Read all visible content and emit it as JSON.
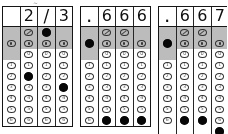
{
  "sheet": {
    "title": "grid-in answer bubble sheets",
    "stray_mark": "~",
    "row_labels": [
      "fraction-bar",
      "decimal-point",
      "0",
      "1",
      "2",
      "3",
      "4",
      "5",
      "6"
    ],
    "colors": {
      "ink": "#0d0d0d",
      "rule": "#2a2a2a",
      "shade": "#b9b9b9",
      "paper": "#ffffff",
      "bubble_outline": "#333333"
    },
    "grids": [
      {
        "name": "grid-1",
        "answer": [
          "",
          "2",
          "/",
          "3"
        ],
        "columns": [
          {
            "name": "col-1",
            "written": "",
            "has_slash_bubble": false,
            "has_dot_bubble": true,
            "has_zero_bubble": false,
            "digits": [
              "1",
              "2",
              "3",
              "4",
              "5",
              "6"
            ],
            "filled": null
          },
          {
            "name": "col-2",
            "written": "2",
            "has_slash_bubble": true,
            "has_dot_bubble": true,
            "has_zero_bubble": true,
            "digits": [
              "0",
              "1",
              "2",
              "3",
              "4",
              "5",
              "6"
            ],
            "filled": "2"
          },
          {
            "name": "col-3",
            "written": "/",
            "has_slash_bubble": true,
            "has_dot_bubble": true,
            "has_zero_bubble": true,
            "digits": [
              "0",
              "1",
              "2",
              "3",
              "4",
              "5",
              "6"
            ],
            "filled": "/"
          },
          {
            "name": "col-4",
            "written": "3",
            "has_slash_bubble": false,
            "has_dot_bubble": true,
            "has_zero_bubble": true,
            "digits": [
              "0",
              "1",
              "2",
              "3",
              "4",
              "5",
              "6"
            ],
            "filled": "3"
          }
        ]
      },
      {
        "name": "grid-2",
        "answer": [
          ".",
          "6",
          "6",
          "6"
        ],
        "columns": [
          {
            "name": "col-1",
            "written": ".",
            "has_slash_bubble": false,
            "has_dot_bubble": true,
            "has_zero_bubble": false,
            "digits": [
              "1",
              "2",
              "3",
              "4",
              "5",
              "6"
            ],
            "filled": "."
          },
          {
            "name": "col-2",
            "written": "6",
            "has_slash_bubble": true,
            "has_dot_bubble": true,
            "has_zero_bubble": true,
            "digits": [
              "0",
              "1",
              "2",
              "3",
              "4",
              "5",
              "6"
            ],
            "filled": "6"
          },
          {
            "name": "col-3",
            "written": "6",
            "has_slash_bubble": true,
            "has_dot_bubble": true,
            "has_zero_bubble": true,
            "digits": [
              "0",
              "1",
              "2",
              "3",
              "4",
              "5",
              "6"
            ],
            "filled": "6"
          },
          {
            "name": "col-4",
            "written": "6",
            "has_slash_bubble": false,
            "has_dot_bubble": true,
            "has_zero_bubble": true,
            "digits": [
              "0",
              "1",
              "2",
              "3",
              "4",
              "5",
              "6"
            ],
            "filled": "6"
          }
        ]
      },
      {
        "name": "grid-3",
        "answer": [
          ".",
          "6",
          "6",
          "7"
        ],
        "columns": [
          {
            "name": "col-1",
            "written": ".",
            "has_slash_bubble": false,
            "has_dot_bubble": true,
            "has_zero_bubble": false,
            "digits": [
              "1",
              "2",
              "3",
              "4",
              "5",
              "6"
            ],
            "filled": "."
          },
          {
            "name": "col-2",
            "written": "6",
            "has_slash_bubble": true,
            "has_dot_bubble": true,
            "has_zero_bubble": true,
            "digits": [
              "0",
              "1",
              "2",
              "3",
              "4",
              "5",
              "6"
            ],
            "filled": "6"
          },
          {
            "name": "col-3",
            "written": "6",
            "has_slash_bubble": true,
            "has_dot_bubble": true,
            "has_zero_bubble": true,
            "digits": [
              "0",
              "1",
              "2",
              "3",
              "4",
              "5",
              "6"
            ],
            "filled": "6"
          },
          {
            "name": "col-4",
            "written": "7",
            "has_slash_bubble": false,
            "has_dot_bubble": true,
            "has_zero_bubble": true,
            "digits": [
              "0",
              "1",
              "2",
              "3",
              "4",
              "5",
              "6"
            ],
            "filled": "7"
          }
        ]
      }
    ]
  }
}
